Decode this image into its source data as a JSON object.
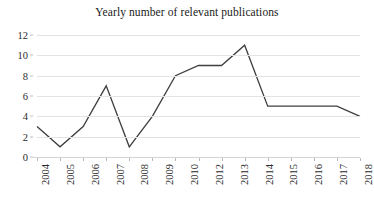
{
  "chart_data": {
    "type": "line",
    "title": "Yearly number of relevant publications",
    "xlabel": "",
    "ylabel": "",
    "x": [
      2004,
      2005,
      2006,
      2007,
      2008,
      2009,
      2010,
      2011,
      2012,
      2013,
      2014,
      2015,
      2016,
      2017,
      2018
    ],
    "values": [
      3,
      1,
      3,
      7,
      1,
      4,
      8,
      9,
      9,
      11,
      5,
      5,
      5,
      5,
      4
    ],
    "series": [
      {
        "name": "Yearly number of relevant publications",
        "values": [
          3,
          1,
          3,
          7,
          1,
          4,
          8,
          9,
          9,
          11,
          5,
          5,
          5,
          5,
          4
        ]
      }
    ],
    "ylim": [
      0,
      12
    ],
    "y_ticks": [
      0,
      2,
      4,
      6,
      8,
      10,
      12
    ],
    "y_tick_labels": [
      "0",
      "2",
      "4",
      "6",
      "8",
      "10",
      "12"
    ],
    "x_tick_labels": [
      "2004",
      "2005",
      "2006",
      "2007",
      "2008",
      "2009",
      "2010",
      "2012",
      "2013",
      "2014",
      "2015",
      "2016",
      "2017",
      "2018"
    ],
    "x_tick_label_rotation": -90,
    "grid": true,
    "grid_axis": "y",
    "legend": false,
    "legend_position": "none",
    "line_color": "#3f3f3f",
    "grid_color": "#e3e3e3",
    "text_color": "#2b2b2b",
    "background_color": "#ffffff",
    "markers": false,
    "annotations": []
  }
}
